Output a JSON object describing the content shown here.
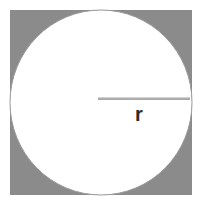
{
  "figure": {
    "canvas": {
      "width": 201,
      "height": 209,
      "background_color": "#ffffff"
    },
    "square": {
      "name": "gray-square",
      "fill_color": "#8b8b8b",
      "x": 10,
      "y": 10,
      "width": 182,
      "height": 185
    },
    "circle": {
      "name": "inscribed-circle",
      "fill_color": "#ffffff",
      "stroke_color": "#9a9a9a",
      "center_x": 101,
      "center_y": 102.5,
      "radius_x": 91,
      "radius_y": 92.5
    },
    "radius_line": {
      "name": "radius-segment",
      "stroke_color": "#8e8e8e",
      "x1": 98,
      "y1": 99,
      "x2": 190,
      "y2": 99,
      "stroke_width": 1.6
    },
    "radius_label": {
      "text": "r",
      "color": "#2b2b2b",
      "x": 135,
      "y": 104,
      "font_size": 20
    }
  }
}
